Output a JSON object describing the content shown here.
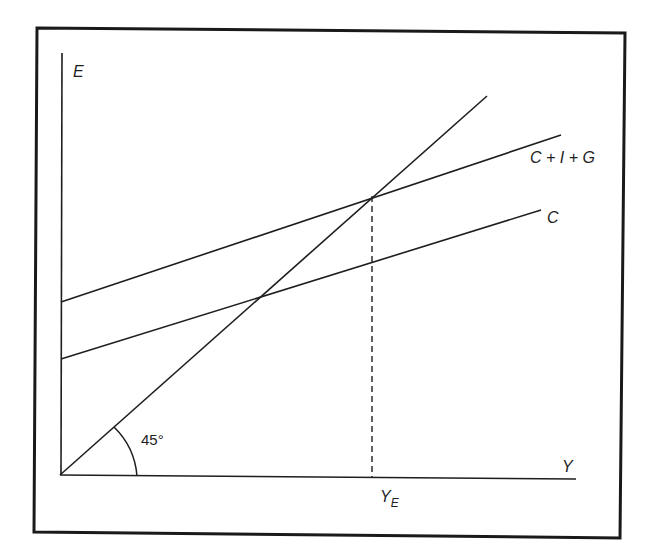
{
  "diagram": {
    "type": "keynesian-cross",
    "frame": {
      "stroke": "#1a1a1a"
    },
    "axes": {
      "y_label": "E",
      "x_label": "Y"
    },
    "lines": [
      {
        "name": "45-degree-line",
        "label": ""
      },
      {
        "name": "aggregate-expenditure-line",
        "label": "C + I + G"
      },
      {
        "name": "consumption-line",
        "label": "C"
      }
    ],
    "angle_label": "45°",
    "equilibrium": {
      "label_main": "Y",
      "label_sub": "E"
    }
  }
}
